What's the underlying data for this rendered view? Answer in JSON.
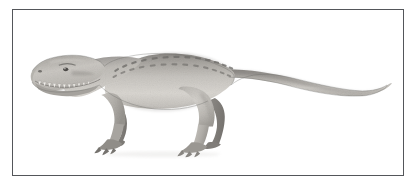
{
  "plate": {
    "title": "Theropod dinosaur lateral view illustration",
    "caption": "",
    "frame": {
      "border_color": "#54565a",
      "border_width_px": 1,
      "background_color": "#ffffff",
      "x": 12,
      "y": 9,
      "width": 392,
      "height": 167
    }
  },
  "figure": {
    "name": "tyrannosaurid-theropod",
    "orientation": "left-facing lateral profile",
    "rendering": "grayscale pencil / airbrush shading",
    "palette": {
      "body_light": "#d6d3ce",
      "body_mid": "#bab7b2",
      "body_shadow": "#9b9893",
      "body_dark": "#7f7d79",
      "limb_dark": "#8b8884",
      "outline": "#6b6a67",
      "marking_dark": "#6e6c69",
      "tooth_white": "#f2f0ec",
      "background": "#ffffff"
    },
    "anatomy": {
      "head_label": "skull with jaws and teeth",
      "eye_label": "eye",
      "nostril_label": "nostril",
      "teeth_count": 11,
      "forelimb_label": "forelimb with claws",
      "hindlimb_label": "hindlimb with clawed foot",
      "tail_label": "long tapering tail",
      "back_markings_label": "dark dorsal dash markings",
      "back_marking_rows": 2,
      "back_marking_count_upper": 13,
      "back_marking_count_lower": 13
    }
  }
}
